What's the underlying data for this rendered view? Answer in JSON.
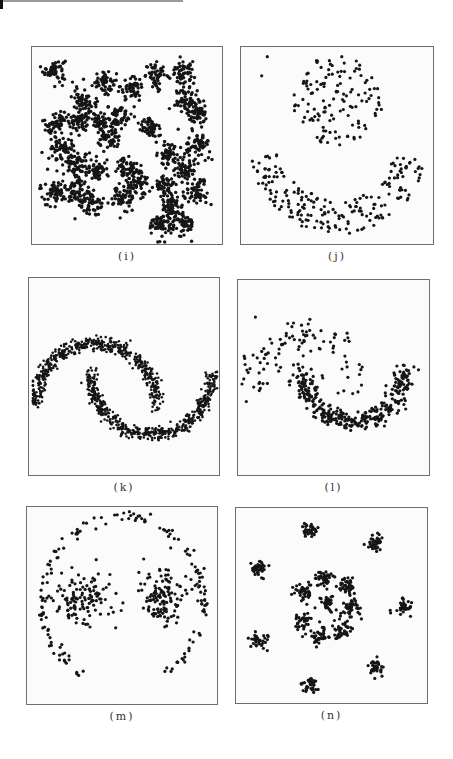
{
  "page": {
    "decor": {
      "top_mark_color": "#111111",
      "top_rule_color": "#9a9a9a"
    },
    "point_color": "#151515",
    "frame_color": "#6e6e6e"
  },
  "chart_data": [
    {
      "id": "i",
      "caption": "(i)",
      "type": "scatter",
      "title": "",
      "xlabel": "",
      "ylabel": "",
      "grid": false,
      "frame": {
        "x": 31,
        "y": 46,
        "w": 192,
        "h": 199
      },
      "dot_radius": 1.7,
      "xlim": [
        0,
        1
      ],
      "ylim": [
        0,
        1
      ],
      "description": "Dense Gaussian blob clusters arranged in a spiral-like pattern",
      "clusters": [
        {
          "cx": 0.1,
          "cy": 0.9,
          "sd": 0.03,
          "n": 55
        },
        {
          "cx": 0.37,
          "cy": 0.84,
          "sd": 0.032,
          "n": 55
        },
        {
          "cx": 0.52,
          "cy": 0.8,
          "sd": 0.03,
          "n": 50
        },
        {
          "cx": 0.66,
          "cy": 0.87,
          "sd": 0.032,
          "n": 55
        },
        {
          "cx": 0.8,
          "cy": 0.88,
          "sd": 0.03,
          "n": 55
        },
        {
          "cx": 0.26,
          "cy": 0.75,
          "sd": 0.032,
          "n": 55
        },
        {
          "cx": 0.82,
          "cy": 0.74,
          "sd": 0.033,
          "n": 60
        },
        {
          "cx": 0.88,
          "cy": 0.66,
          "sd": 0.03,
          "n": 50
        },
        {
          "cx": 0.11,
          "cy": 0.62,
          "sd": 0.035,
          "n": 60
        },
        {
          "cx": 0.23,
          "cy": 0.64,
          "sd": 0.033,
          "n": 55
        },
        {
          "cx": 0.34,
          "cy": 0.64,
          "sd": 0.032,
          "n": 55
        },
        {
          "cx": 0.45,
          "cy": 0.66,
          "sd": 0.032,
          "n": 55
        },
        {
          "cx": 0.62,
          "cy": 0.6,
          "sd": 0.03,
          "n": 50
        },
        {
          "cx": 0.4,
          "cy": 0.54,
          "sd": 0.033,
          "n": 55
        },
        {
          "cx": 0.14,
          "cy": 0.48,
          "sd": 0.034,
          "n": 60
        },
        {
          "cx": 0.88,
          "cy": 0.5,
          "sd": 0.034,
          "n": 60
        },
        {
          "cx": 0.72,
          "cy": 0.46,
          "sd": 0.033,
          "n": 55
        },
        {
          "cx": 0.22,
          "cy": 0.4,
          "sd": 0.032,
          "n": 55
        },
        {
          "cx": 0.33,
          "cy": 0.38,
          "sd": 0.033,
          "n": 55
        },
        {
          "cx": 0.49,
          "cy": 0.39,
          "sd": 0.033,
          "n": 55
        },
        {
          "cx": 0.82,
          "cy": 0.38,
          "sd": 0.033,
          "n": 55
        },
        {
          "cx": 0.55,
          "cy": 0.3,
          "sd": 0.032,
          "n": 55
        },
        {
          "cx": 0.71,
          "cy": 0.3,
          "sd": 0.032,
          "n": 55
        },
        {
          "cx": 0.88,
          "cy": 0.26,
          "sd": 0.032,
          "n": 55
        },
        {
          "cx": 0.1,
          "cy": 0.27,
          "sd": 0.034,
          "n": 60
        },
        {
          "cx": 0.22,
          "cy": 0.27,
          "sd": 0.032,
          "n": 55
        },
        {
          "cx": 0.47,
          "cy": 0.23,
          "sd": 0.032,
          "n": 55
        },
        {
          "cx": 0.31,
          "cy": 0.2,
          "sd": 0.033,
          "n": 55
        },
        {
          "cx": 0.74,
          "cy": 0.18,
          "sd": 0.034,
          "n": 60
        },
        {
          "cx": 0.68,
          "cy": 0.09,
          "sd": 0.033,
          "n": 60
        },
        {
          "cx": 0.8,
          "cy": 0.1,
          "sd": 0.033,
          "n": 55
        }
      ]
    },
    {
      "id": "j",
      "caption": "(j)",
      "type": "scatter",
      "title": "",
      "xlabel": "",
      "ylabel": "",
      "grid": false,
      "frame": {
        "x": 240,
        "y": 46,
        "w": 194,
        "h": 199
      },
      "dot_radius": 1.6,
      "xlim": [
        0,
        1
      ],
      "ylim": [
        0,
        1
      ],
      "description": "Sparse uniformly spaced points: a disc in upper-center and a U-shaped crescent below",
      "shapes": [
        {
          "kind": "disc",
          "cx": 0.5,
          "cy": 0.74,
          "r": 0.24,
          "n": 130
        },
        {
          "kind": "arc",
          "cx": 0.5,
          "cy": 0.52,
          "r_inner": 0.3,
          "r_outer": 0.48,
          "a0": 190,
          "a1": 350,
          "n": 200
        }
      ],
      "outliers": [
        [
          0.12,
          0.97
        ],
        [
          0.09,
          0.87
        ]
      ]
    },
    {
      "id": "k",
      "caption": "(k)",
      "type": "scatter",
      "title": "",
      "xlabel": "",
      "ylabel": "",
      "grid": false,
      "frame": {
        "x": 28,
        "y": 277,
        "w": 192,
        "h": 199
      },
      "dot_radius": 1.3,
      "xlim": [
        0,
        1
      ],
      "ylim": [
        0,
        1
      ],
      "description": "Two interleaving half-moons (dense, noisy)",
      "shapes": [
        {
          "kind": "moon",
          "cx": 0.34,
          "cy": 0.35,
          "r": 0.33,
          "a0": 0,
          "a1": 180,
          "noise": 0.018,
          "n": 520
        },
        {
          "kind": "moon",
          "cx": 0.64,
          "cy": 0.53,
          "r": 0.33,
          "a0": 180,
          "a1": 360,
          "noise": 0.018,
          "n": 520
        }
      ]
    },
    {
      "id": "l",
      "caption": "(l)",
      "type": "scatter",
      "title": "",
      "xlabel": "",
      "ylabel": "",
      "grid": false,
      "frame": {
        "x": 237,
        "y": 279,
        "w": 193,
        "h": 197
      },
      "dot_radius": 1.6,
      "xlim": [
        0,
        1
      ],
      "ylim": [
        0,
        1
      ],
      "description": "Two half-moons with unequal density: sparse upper moon, dense lower moon",
      "shapes": [
        {
          "kind": "moon",
          "cx": 0.33,
          "cy": 0.45,
          "r": 0.26,
          "a0": 0,
          "a1": 180,
          "noise": 0.05,
          "n": 100
        },
        {
          "kind": "moon",
          "cx": 0.6,
          "cy": 0.55,
          "r": 0.28,
          "a0": 180,
          "a1": 360,
          "noise": 0.028,
          "n": 340
        }
      ]
    },
    {
      "id": "m",
      "caption": "(m)",
      "type": "scatter",
      "title": "",
      "xlabel": "",
      "ylabel": "",
      "grid": false,
      "frame": {
        "x": 26,
        "y": 506,
        "w": 192,
        "h": 199
      },
      "dot_radius": 1.6,
      "xlim": [
        0,
        1
      ],
      "ylim": [
        0,
        1
      ],
      "description": "Two Gaussian clusters enclosed by a sparse, open ring",
      "shapes": [
        {
          "kind": "ring",
          "cx": 0.5,
          "cy": 0.53,
          "r": 0.44,
          "a0": -62,
          "a1": 242,
          "noise": 0.015,
          "n": 150
        }
      ],
      "clusters": [
        {
          "cx": 0.28,
          "cy": 0.55,
          "sd": 0.075,
          "n": 120
        },
        {
          "cx": 0.72,
          "cy": 0.55,
          "sd": 0.08,
          "n": 130
        }
      ]
    },
    {
      "id": "n",
      "caption": "(n)",
      "type": "scatter",
      "title": "",
      "xlabel": "",
      "ylabel": "",
      "grid": false,
      "frame": {
        "x": 235,
        "y": 507,
        "w": 193,
        "h": 197
      },
      "dot_radius": 1.6,
      "xlim": [
        0,
        1
      ],
      "ylim": [
        0,
        1
      ],
      "description": "Tight clusters: a center blob, an inner ring of 7 clusters, and an outer ring of 8 clusters",
      "clusters": [
        {
          "cx": 0.47,
          "cy": 0.52,
          "sd": 0.02,
          "n": 30
        },
        {
          "cx": 0.45,
          "cy": 0.65,
          "sd": 0.025,
          "n": 40
        },
        {
          "cx": 0.57,
          "cy": 0.61,
          "sd": 0.025,
          "n": 40
        },
        {
          "cx": 0.6,
          "cy": 0.49,
          "sd": 0.025,
          "n": 40
        },
        {
          "cx": 0.55,
          "cy": 0.38,
          "sd": 0.025,
          "n": 40
        },
        {
          "cx": 0.43,
          "cy": 0.35,
          "sd": 0.025,
          "n": 40
        },
        {
          "cx": 0.34,
          "cy": 0.43,
          "sd": 0.025,
          "n": 40
        },
        {
          "cx": 0.34,
          "cy": 0.58,
          "sd": 0.025,
          "n": 40
        },
        {
          "cx": 0.38,
          "cy": 0.91,
          "sd": 0.022,
          "n": 35
        },
        {
          "cx": 0.73,
          "cy": 0.84,
          "sd": 0.022,
          "n": 35
        },
        {
          "cx": 0.1,
          "cy": 0.7,
          "sd": 0.022,
          "n": 35
        },
        {
          "cx": 0.89,
          "cy": 0.5,
          "sd": 0.022,
          "n": 35
        },
        {
          "cx": 0.1,
          "cy": 0.32,
          "sd": 0.022,
          "n": 35
        },
        {
          "cx": 0.73,
          "cy": 0.18,
          "sd": 0.022,
          "n": 35
        },
        {
          "cx": 0.38,
          "cy": 0.08,
          "sd": 0.022,
          "n": 35
        }
      ]
    }
  ]
}
